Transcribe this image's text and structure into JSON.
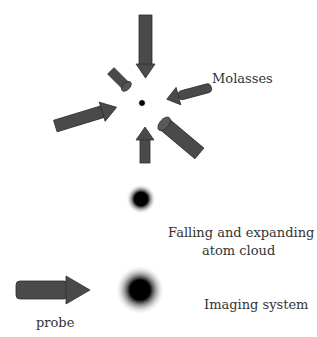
{
  "diagram": {
    "labels": {
      "molasses": "Molasses",
      "falling_line1": "Falling and expanding",
      "falling_line2": "atom cloud",
      "imaging": "Imaging system",
      "probe": "probe"
    },
    "elements": {
      "molasses_beams": 6,
      "beam_color": "#4a4a4a",
      "cloud_color": "#000000"
    }
  }
}
